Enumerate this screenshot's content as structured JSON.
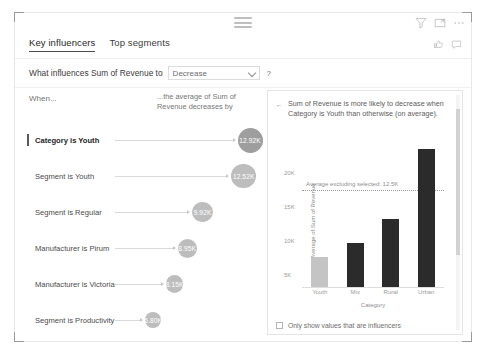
{
  "visual": {
    "chrome": {
      "drag_handle": "drag-handle",
      "filter_icon": "filter-icon",
      "focus_icon": "focus-mode-icon",
      "more_icon": "more-options-icon",
      "like_icon": "thumbs-up-icon",
      "comment_icon": "comment-icon"
    },
    "tabs": [
      {
        "label": "Key influencers",
        "active": true
      },
      {
        "label": "Top segments",
        "active": false
      }
    ],
    "question": {
      "label": "What influences Sum of Revenue to",
      "select_value": "Decrease",
      "help_label": "?"
    },
    "left": {
      "when_label": "When...",
      "average_label": "...the average of Sum of Revenue decreases by",
      "influencers": [
        {
          "label": "Category is Youth",
          "value": "12.92K",
          "selected": true
        },
        {
          "label": "Segment is Youth",
          "value": "12.52K",
          "selected": false
        },
        {
          "label": "Segment is Regular",
          "value": "9.92K",
          "selected": false
        },
        {
          "label": "Manufacturer is Pirum",
          "value": "8.95K",
          "selected": false
        },
        {
          "label": "Manufacturer is Victoria",
          "value": "8.15K",
          "selected": false
        },
        {
          "label": "Segment is Productivity",
          "value": "6.80K",
          "selected": false
        },
        {
          "label": "State is NY",
          "value": "6.28K",
          "selected": false
        }
      ]
    },
    "right": {
      "insight_bullet": "←",
      "insight_text": "Sum of Revenue is more likely to decrease when Category is Youth than otherwise (on average).",
      "footer_checkbox_label": "Only show values that are influencers",
      "footer_checkbox_checked": false
    }
  },
  "chart_data": {
    "type": "bar",
    "title": "",
    "categories": [
      "Youth",
      "Mix",
      "Rural",
      "Urban"
    ],
    "values": [
      5.2,
      7.6,
      11.5,
      23.4
    ],
    "bar_colors": [
      "#c4c4c4",
      "#2b2b2b",
      "#2b2b2b",
      "#2b2b2b"
    ],
    "highlight_index": 0,
    "xlabel": "Category",
    "ylabel": "Average of Sum of Revenue",
    "ylim": [
      0,
      25
    ],
    "yticks": [
      5,
      10,
      15,
      20
    ],
    "ytick_labels": [
      "5K",
      "10K",
      "15K",
      "20K"
    ],
    "grid": false,
    "legend": "none",
    "annotations": [
      {
        "type": "reference-line",
        "label": "Average excluding selected: 12.5K",
        "value": 16.4,
        "style": "dotted"
      }
    ]
  }
}
